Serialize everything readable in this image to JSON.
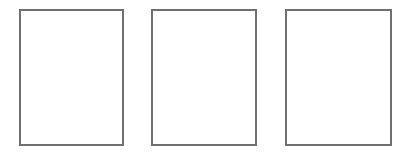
{
  "canvas": {
    "width": 410,
    "height": 157,
    "background": "#ffffff"
  },
  "panels": [
    {
      "id": "panel-1",
      "content": "",
      "border_color": "#707070"
    },
    {
      "id": "panel-2",
      "content": "",
      "border_color": "#707070"
    },
    {
      "id": "panel-3",
      "content": "",
      "border_color": "#707070"
    }
  ]
}
